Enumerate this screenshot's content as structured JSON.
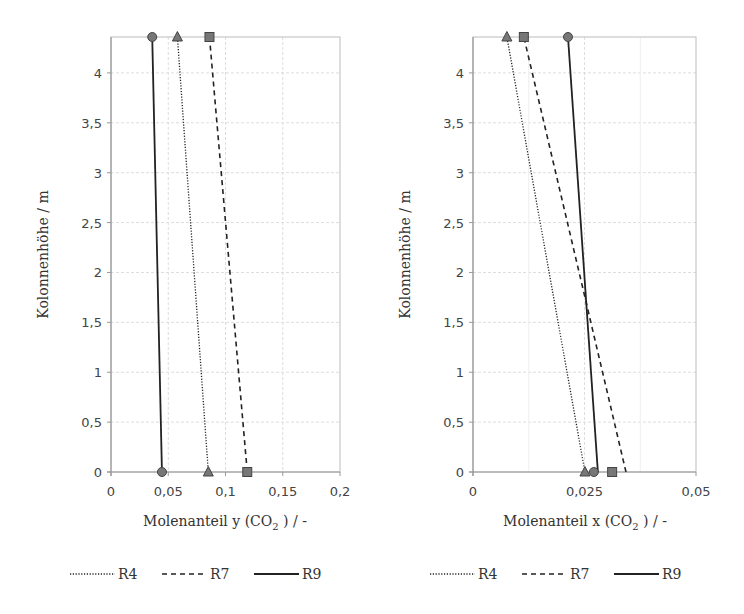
{
  "chart_data": [
    {
      "type": "line",
      "title": "",
      "xlabel": "Molenanteil y (CO2 ) / -",
      "ylabel": "Kolonnenhöhe / m",
      "xlim": [
        0,
        0.2
      ],
      "ylim": [
        0,
        4.36
      ],
      "xticks": [
        "0",
        "0,05",
        "0,1",
        "0,15",
        "0,2"
      ],
      "yticks": [
        "0",
        "0,5",
        "1",
        "1,5",
        "2",
        "2,5",
        "3",
        "3,5",
        "4"
      ],
      "grid": true,
      "legend_position": "bottom",
      "series": [
        {
          "name": "R4",
          "style": "dotted",
          "marker": "triangle",
          "points": [
            [
              0.085,
              0
            ],
            [
              0.058,
              4.36
            ]
          ]
        },
        {
          "name": "R7",
          "style": "dashed",
          "marker": "square",
          "points": [
            [
              0.119,
              0
            ],
            [
              0.086,
              4.36
            ]
          ]
        },
        {
          "name": "R9",
          "style": "solid",
          "marker": "circle",
          "points": [
            [
              0.0445,
              0
            ],
            [
              0.036,
              4.36
            ]
          ]
        }
      ]
    },
    {
      "type": "line",
      "title": "",
      "xlabel": "Molenanteil x (CO2 ) / -",
      "ylabel": "Kolonnenhöhe / m",
      "xlim": [
        0,
        0.05
      ],
      "ylim": [
        0,
        4.36
      ],
      "xticks": [
        "0",
        "0,025",
        "0,05"
      ],
      "yticks": [
        "0",
        "0,5",
        "1",
        "1,5",
        "2",
        "2,5",
        "3",
        "3,5",
        "4"
      ],
      "grid": true,
      "legend_position": "bottom",
      "series": [
        {
          "name": "R4",
          "style": "dotted",
          "marker": "triangle",
          "points": [
            [
              0.0251,
              0
            ],
            [
              0.0076,
              4.36
            ]
          ],
          "marker_points": [
            [
              0.0251,
              0
            ],
            [
              0.0076,
              4.36
            ]
          ]
        },
        {
          "name": "R7",
          "style": "dashed",
          "marker": "square",
          "points": [
            [
              0.0343,
              0
            ],
            [
              0.0114,
              4.36
            ]
          ],
          "marker_points": [
            [
              0.0312,
              0
            ],
            [
              0.0114,
              4.36
            ]
          ]
        },
        {
          "name": "R9",
          "style": "solid",
          "marker": "circle",
          "points": [
            [
              0.028,
              0
            ],
            [
              0.0213,
              4.36
            ]
          ],
          "marker_points": [
            [
              0.0271,
              0
            ],
            [
              0.0213,
              4.36
            ]
          ]
        }
      ]
    }
  ],
  "labels": {
    "left_xlabel_main": "Molenanteil y (CO",
    "right_xlabel_main": "Molenanteil x (CO",
    "sub2": "2",
    "xlabel_tail": " ) / -",
    "ylabel": "Kolonnenhöhe / m"
  },
  "legend": [
    "R4",
    "R7",
    "R9"
  ],
  "colors": {
    "line": "#222222",
    "marker_fill": "#777777",
    "grid": "#dddddd",
    "axis": "#999999"
  }
}
